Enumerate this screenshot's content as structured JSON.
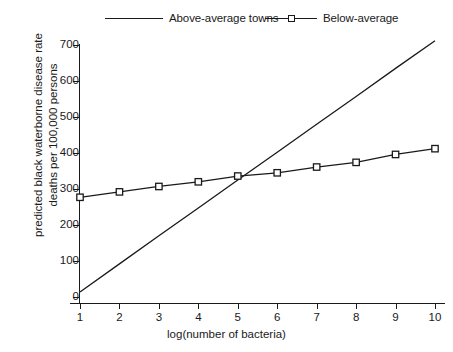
{
  "chart_data": {
    "type": "line",
    "title": "",
    "xlabel": "log(number of bacteria)",
    "ylabel": "predicted black waterborne disease rate deaths per 100,000 persons",
    "ylabel_lines": [
      "predicted black waterborne disease rate",
      "deaths per 100,000 persons"
    ],
    "x": [
      1,
      2,
      3,
      4,
      5,
      6,
      7,
      8,
      9,
      10
    ],
    "xlim": [
      1,
      10
    ],
    "ylim": [
      0,
      730
    ],
    "xticks": [
      1,
      2,
      3,
      4,
      5,
      6,
      7,
      8,
      9,
      10
    ],
    "yticks": [
      0,
      100,
      200,
      300,
      400,
      500,
      600,
      700
    ],
    "xticklabels": [
      "1",
      "2",
      "3",
      "4",
      "5",
      "6",
      "7",
      "8",
      "9",
      "10"
    ],
    "yticklabels": [
      "0",
      "100",
      "200",
      "300",
      "400",
      "500",
      "600",
      "700"
    ],
    "grid": false,
    "legend_position": "above-plot",
    "series": [
      {
        "name": "Above-average towns",
        "marker": "none",
        "color": "#1a1a1a",
        "values": [
          14,
          92,
          170,
          247,
          325,
          402,
          480,
          557,
          635,
          712
        ]
      },
      {
        "name": "Below-average",
        "marker": "square",
        "color": "#1a1a1a",
        "values": [
          277,
          292,
          307,
          320,
          336,
          345,
          361,
          374,
          396,
          412
        ]
      }
    ]
  },
  "legend": {
    "entries": [
      {
        "label": "Above-average towns",
        "marker": "none"
      },
      {
        "label": "Below-average",
        "marker": "square"
      }
    ]
  },
  "colors": {
    "ink": "#1a1a1a",
    "background": "#ffffff"
  }
}
